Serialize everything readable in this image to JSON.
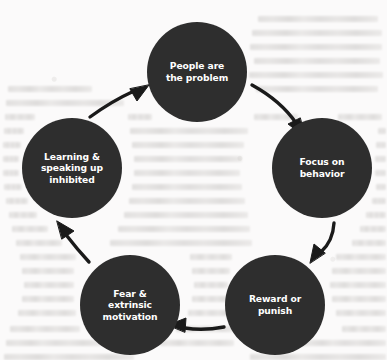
{
  "diagram": {
    "type": "cycle",
    "direction": "clockwise",
    "node_fill": "#2e2e2e",
    "node_text_color": "#ffffff",
    "arrow_color": "#1a1a1a",
    "background_color": "#fbfafa",
    "node_diameter": 100,
    "nodes": [
      {
        "id": "people-are-the-problem",
        "label": "People are\nthe problem",
        "cx": 197,
        "cy": 72,
        "r": 50
      },
      {
        "id": "focus-on-behavior",
        "label": "Focus on\nbehavior",
        "cx": 322,
        "cy": 168,
        "r": 50
      },
      {
        "id": "reward-or-punish",
        "label": "Reward or\npunish",
        "cx": 275,
        "cy": 305,
        "r": 50
      },
      {
        "id": "fear-and-extrinsic-motivation",
        "label": "Fear &\nextrinsic\nmotivation",
        "cx": 130,
        "cy": 305,
        "r": 50
      },
      {
        "id": "learning-and-speaking-up-inhibited",
        "label": "Learning &\nspeaking up\ninhibited",
        "cx": 72,
        "cy": 168,
        "r": 50
      }
    ],
    "arrows": [
      {
        "id": "arrow-people-to-focus",
        "from": "people-are-the-problem",
        "to": "focus-on-behavior"
      },
      {
        "id": "arrow-focus-to-reward",
        "from": "focus-on-behavior",
        "to": "reward-or-punish"
      },
      {
        "id": "arrow-reward-to-fear",
        "from": "reward-or-punish",
        "to": "fear-and-extrinsic-motivation"
      },
      {
        "id": "arrow-fear-to-learning",
        "from": "fear-and-extrinsic-motivation",
        "to": "learning-and-speaking-up-inhibited"
      },
      {
        "id": "arrow-learning-to-people",
        "from": "learning-and-speaking-up-inhibited",
        "to": "people-are-the-problem"
      }
    ]
  }
}
